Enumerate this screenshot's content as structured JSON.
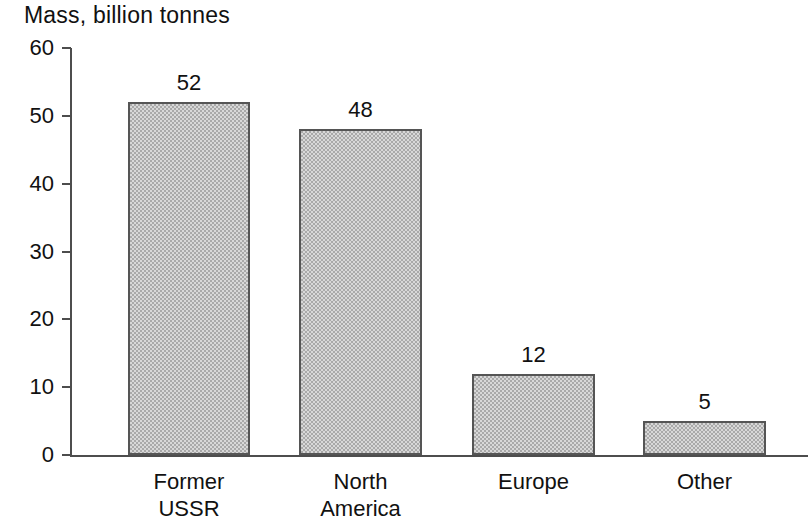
{
  "chart_data": {
    "type": "bar",
    "title": "Mass, billion tonnes",
    "xlabel": "",
    "ylabel": "Mass, billion tonnes",
    "categories": [
      "Former USSR",
      "North America",
      "Europe",
      "Other"
    ],
    "category_lines": [
      [
        "Former",
        "USSR"
      ],
      [
        "North",
        "America"
      ],
      [
        "Europe",
        ""
      ],
      [
        "Other",
        ""
      ]
    ],
    "values": [
      52,
      48,
      12,
      5
    ],
    "value_labels": [
      "52",
      "48",
      "12",
      "5"
    ],
    "ylim": [
      0,
      60
    ],
    "yticks": [
      60,
      50,
      40,
      30,
      20,
      10,
      0
    ],
    "ytick_labels": [
      "60",
      "50",
      "40",
      "30",
      "20",
      "10",
      "0"
    ],
    "grid": false,
    "legend": false,
    "bar_fill_color": "#a9a9a9",
    "bar_edge_color": "#555555",
    "axis_color": "#4d4d4d",
    "text_color": "#111111",
    "background_color": "#ffffff"
  }
}
